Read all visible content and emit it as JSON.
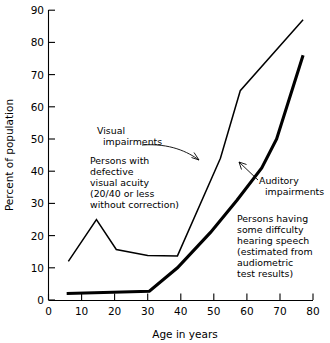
{
  "chart_data": {
    "type": "line",
    "title": "",
    "xlabel": "Age in years",
    "ylabel": "Percent of population",
    "xlim": [
      0,
      80
    ],
    "ylim": [
      0,
      90
    ],
    "xticks": [
      0,
      10,
      20,
      30,
      40,
      50,
      60,
      70,
      80
    ],
    "yticks": [
      0,
      10,
      20,
      30,
      40,
      50,
      60,
      70,
      80,
      90
    ],
    "grid": false,
    "legend_position": "inline-annotations",
    "series": [
      {
        "name": "Visual impairments",
        "points": [
          [
            6,
            12
          ],
          [
            14.5,
            25
          ],
          [
            20.5,
            15.7
          ],
          [
            30,
            13.8
          ],
          [
            39,
            13.7
          ],
          [
            52,
            44
          ],
          [
            58,
            65
          ],
          [
            77,
            87
          ]
        ]
      },
      {
        "name": "Auditory impairments",
        "points": [
          [
            5.5,
            2
          ],
          [
            30.5,
            2.7
          ],
          [
            39,
            10
          ],
          [
            49,
            21
          ],
          [
            57,
            31
          ],
          [
            64.5,
            41
          ],
          [
            69,
            50
          ],
          [
            77,
            76
          ]
        ]
      }
    ],
    "annotations": [
      {
        "name": "visual-impairments-label",
        "lines": [
          "Visual",
          "impairments"
        ],
        "target_series": "Visual impairments"
      },
      {
        "name": "visual-impairments-description",
        "lines": [
          "Persons with",
          "defective",
          "visual acuity",
          "(20/40 or less",
          "without correction)"
        ]
      },
      {
        "name": "auditory-impairments-label",
        "lines": [
          "Auditory",
          "impairments"
        ],
        "target_series": "Auditory impairments"
      },
      {
        "name": "auditory-impairments-description",
        "lines": [
          "Persons having",
          "some diffculty",
          "hearing speech",
          "(estimated from",
          "audiometric",
          "test results)"
        ]
      }
    ]
  },
  "axes": {
    "x_title": "Age in years",
    "y_title": "Percent of population",
    "x_tick_labels": [
      "0",
      "10",
      "20",
      "30",
      "40",
      "50",
      "60",
      "70",
      "80"
    ],
    "y_tick_labels": [
      "0",
      "10",
      "20",
      "30",
      "40",
      "50",
      "60",
      "70",
      "80",
      "90"
    ]
  },
  "annotations": {
    "visual_label_line1": "Visual",
    "visual_label_line2": "impairments",
    "visual_desc_line1": "Persons with",
    "visual_desc_line2": "defective",
    "visual_desc_line3": "visual acuity",
    "visual_desc_line4": "(20/40 or less",
    "visual_desc_line5": "without correction)",
    "auditory_label_line1": "Auditory",
    "auditory_label_line2": "impairments",
    "auditory_desc_line1": "Persons having",
    "auditory_desc_line2": "some diffculty",
    "auditory_desc_line3": "hearing speech",
    "auditory_desc_line4": "(estimated from",
    "auditory_desc_line5": "audiometric",
    "auditory_desc_line6": "test results)"
  },
  "colors": {
    "ink": "#000000",
    "background": "#ffffff"
  }
}
